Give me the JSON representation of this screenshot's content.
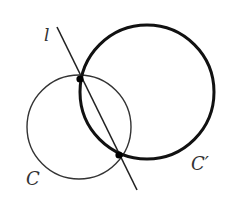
{
  "diagram": {
    "width": 234,
    "height": 202,
    "background": "#ffffff",
    "line": {
      "label": "l",
      "x1": 57,
      "y1": 27,
      "x2": 137,
      "y2": 190,
      "color": "#222222",
      "stroke_width": 1.6
    },
    "circle_small": {
      "label": "C",
      "cx": 79,
      "cy": 127,
      "r": 52,
      "color": "#333333",
      "stroke_width": 1.4
    },
    "circle_large": {
      "label": "C′",
      "cx": 147,
      "cy": 92,
      "r": 67,
      "color": "#111111",
      "stroke_width": 3
    },
    "intersections": [
      {
        "name": "upper",
        "x": 80,
        "y": 79,
        "r": 3.6
      },
      {
        "name": "lower",
        "x": 119,
        "y": 155,
        "r": 3.6
      }
    ],
    "labels": {
      "l": {
        "text": "l",
        "x": 44,
        "y": 41,
        "size": 17
      },
      "C": {
        "text": "C",
        "x": 26,
        "y": 185,
        "size": 18
      },
      "Cprime": {
        "text": "C′",
        "x": 191,
        "y": 170,
        "size": 18
      }
    }
  }
}
